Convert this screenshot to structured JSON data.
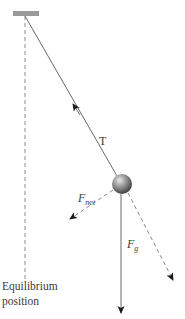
{
  "diagram": {
    "colors": {
      "background": "#ffffff",
      "line": "#6a6a6a",
      "dashed": "#8a8a8a",
      "arrowhead": "#1a1a1a",
      "support": "#9a9a9a",
      "bob_light": "#d8d8d8",
      "bob_dark": "#4a4a4a",
      "text": "#3a3a3a"
    },
    "support": {
      "x": 13,
      "y": 11,
      "width": 26,
      "height": 5
    },
    "pivot": {
      "x": 25,
      "y": 16
    },
    "bob": {
      "cx": 122,
      "cy": 184,
      "r": 10
    },
    "equilibrium_line": {
      "x": 25,
      "y1": 16,
      "y2": 280
    },
    "vectors": {
      "tension": {
        "label": "T",
        "from": [
          117,
          175
        ],
        "to": [
          73,
          104
        ],
        "style": "solid"
      },
      "net_force": {
        "label_main": "F",
        "label_sub": "net",
        "from": [
          113,
          190
        ],
        "to": [
          70,
          219
        ],
        "style": "dashed"
      },
      "gravity": {
        "label_main": "F",
        "label_sub": "g",
        "from": [
          121,
          194
        ],
        "to": [
          121,
          313
        ],
        "style": "solid"
      },
      "string_extension": {
        "from": [
          128,
          193
        ],
        "to": [
          173,
          280
        ],
        "style": "dashed"
      }
    }
  },
  "labels": {
    "tension": "T",
    "net_force_main": "F",
    "net_force_sub": "net",
    "gravity_main": "F",
    "gravity_sub": "g",
    "equilibrium_line1": "Equilibrium",
    "equilibrium_line2": "position"
  }
}
